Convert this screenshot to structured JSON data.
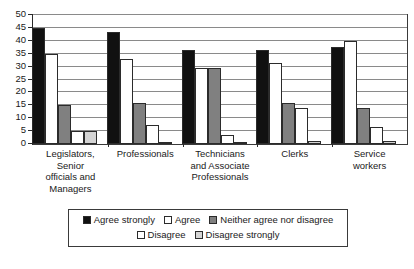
{
  "chart_data": {
    "type": "bar",
    "title": "",
    "subtitle": "",
    "xlabel": "",
    "ylabel": "",
    "ylim": [
      0,
      50
    ],
    "ytick_step": 5,
    "yticks": [
      0,
      5,
      10,
      15,
      20,
      25,
      30,
      35,
      40,
      45,
      50
    ],
    "grid": true,
    "grid_axis": "y",
    "legend_position": "bottom",
    "orientation": "vertical",
    "grouping": "clustered",
    "categories": [
      "Legislators, Senior officials and Managers",
      "Professionals",
      "Technicians and Associate Professionals",
      "Clerks",
      "Service workers"
    ],
    "category_label_lines": [
      [
        "Legislators,",
        "Senior",
        "officials and",
        "Managers"
      ],
      [
        "Professionals"
      ],
      [
        "Technicians",
        "and Associate",
        "Professionals"
      ],
      [
        "Clerks"
      ],
      [
        "Service",
        "workers"
      ]
    ],
    "series": [
      {
        "name": "Agree strongly",
        "color": "#111111",
        "values": [
          45,
          43.5,
          36.5,
          36.5,
          37.5
        ]
      },
      {
        "name": "Agree",
        "color": "#ffffff",
        "values": [
          35,
          33,
          29.5,
          31.5,
          40
        ]
      },
      {
        "name": "Neither agree nor disagree",
        "color": "#808080",
        "values": [
          15,
          16,
          29.5,
          16,
          14
        ]
      },
      {
        "name": "Disagree",
        "color": "#ffffff",
        "values": [
          5,
          7.5,
          3.5,
          14,
          6.5
        ]
      },
      {
        "name": "Disagree strongly",
        "color": "#d4d4d4",
        "values": [
          5,
          0.3,
          0.2,
          1,
          1
        ]
      }
    ]
  },
  "legend": {
    "rows": [
      [
        "Agree strongly",
        "Agree",
        "Neither agree nor disagree"
      ],
      [
        "Disagree",
        "Disagree strongly"
      ]
    ]
  }
}
